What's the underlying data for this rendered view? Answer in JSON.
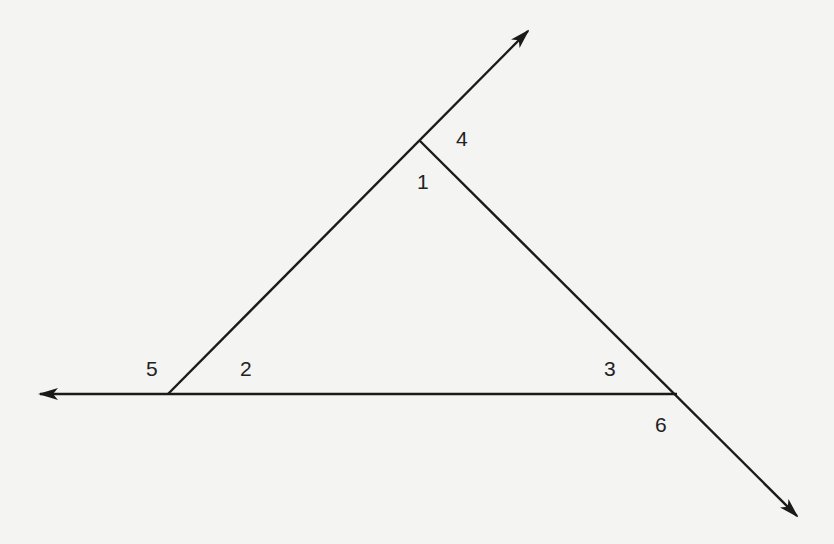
{
  "diagram": {
    "type": "triangle-exterior-angles",
    "stroke_color": "#1a1a1a",
    "background_color": "#f4f4f3",
    "vertices": {
      "top": [
        420,
        141
      ],
      "left": [
        168,
        394
      ],
      "right": [
        677,
        394
      ]
    },
    "rays": [
      {
        "name": "ray-upper-right",
        "from": [
          168,
          394
        ],
        "to": [
          528,
          31
        ]
      },
      {
        "name": "ray-left",
        "from": [
          677,
          394
        ],
        "to": [
          40,
          394
        ]
      },
      {
        "name": "ray-lower-right",
        "from": [
          420,
          141
        ],
        "to": [
          797,
          516
        ]
      }
    ],
    "angle_labels": [
      {
        "id": "1",
        "text": "1",
        "x": 417,
        "y": 171,
        "description": "interior angle at top vertex"
      },
      {
        "id": "2",
        "text": "2",
        "x": 240,
        "y": 358,
        "description": "interior angle at left vertex"
      },
      {
        "id": "3",
        "text": "3",
        "x": 604,
        "y": 358,
        "description": "interior angle at right vertex"
      },
      {
        "id": "4",
        "text": "4",
        "x": 456,
        "y": 128,
        "description": "exterior angle at top vertex"
      },
      {
        "id": "5",
        "text": "5",
        "x": 146,
        "y": 358,
        "description": "exterior angle at left vertex"
      },
      {
        "id": "6",
        "text": "6",
        "x": 655,
        "y": 414,
        "description": "exterior angle at right vertex"
      }
    ]
  }
}
